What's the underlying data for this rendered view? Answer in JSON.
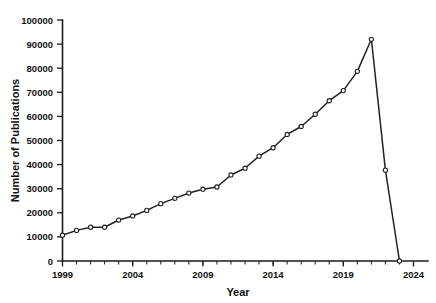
{
  "chart_data": {
    "type": "line",
    "title": "",
    "xlabel": "Year",
    "ylabel": "Number of Publications",
    "xlim": [
      1999,
      2024
    ],
    "ylim": [
      0,
      100000
    ],
    "grid": false,
    "legend": false,
    "legend_position": "none",
    "x_tick_labels": [
      "1999",
      "2004",
      "2009",
      "2014",
      "2019",
      "2024"
    ],
    "x_major_ticks": [
      1999,
      2004,
      2009,
      2014,
      2019,
      2024
    ],
    "x_minor_tick_step": 1,
    "y_tick_labels": [
      "0",
      "10000",
      "20000",
      "30000",
      "40000",
      "50000",
      "60000",
      "70000",
      "80000",
      "90000",
      "100000"
    ],
    "y_major_ticks": [
      0,
      10000,
      20000,
      30000,
      40000,
      50000,
      60000,
      70000,
      80000,
      90000,
      100000
    ],
    "x": [
      1999,
      2000,
      2001,
      2002,
      2003,
      2004,
      2005,
      2006,
      2007,
      2008,
      2009,
      2010,
      2011,
      2012,
      2013,
      2014,
      2015,
      2016,
      2017,
      2018,
      2019,
      2020,
      2021,
      2022,
      2023
    ],
    "values": [
      10700,
      12700,
      14000,
      14000,
      17000,
      18700,
      21000,
      23800,
      26000,
      28200,
      29800,
      30700,
      35700,
      38500,
      43500,
      47000,
      52500,
      55800,
      60900,
      66500,
      70700,
      78700,
      92000,
      37700,
      0
    ],
    "series": [
      {
        "name": "Number of Publications",
        "marker": "circle",
        "color": "#222222",
        "values": [
          10700,
          12700,
          14000,
          14000,
          17000,
          18700,
          21000,
          23800,
          26000,
          28200,
          29800,
          30700,
          35700,
          38500,
          43500,
          47000,
          52500,
          55800,
          60900,
          66500,
          70700,
          78700,
          92000,
          37700,
          0
        ]
      }
    ],
    "peak": {
      "year": 2021,
      "value": 92000
    },
    "annotations": []
  },
  "axes": {
    "y_axis_title": "Number of Publications",
    "x_axis_title": "Year"
  },
  "colors": {
    "line": "#222222",
    "marker_fill": "#ffffff",
    "axis": "#1b1b1b",
    "background": "#ffffff",
    "text": "#111111"
  }
}
